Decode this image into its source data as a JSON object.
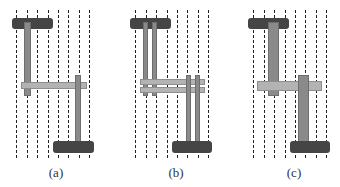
{
  "figure": {
    "panels": [
      {
        "id": "a",
        "label": "(a)",
        "variant": "single-track"
      },
      {
        "id": "b",
        "label": "(b)",
        "variant": "double-track"
      },
      {
        "id": "c",
        "label": "(c)",
        "variant": "wide-track"
      }
    ],
    "grid": {
      "dashed_lines_per_panel": 8,
      "line_color": "#222222"
    },
    "colors": {
      "end_bar": "#454545",
      "vertical_track": "#8a8a8a",
      "horizontal_track": "#b3b3b3",
      "background": "#ffffff"
    }
  }
}
